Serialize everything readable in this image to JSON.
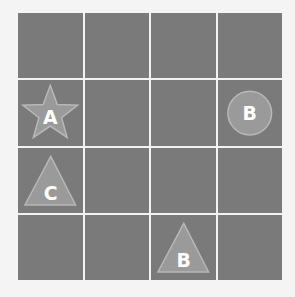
{
  "board": {
    "rows": 4,
    "cols": 4,
    "cell_color": "#7a7a7a",
    "line_color": "#f2f2f2",
    "piece_fill": "#9a9a9a",
    "piece_stroke": "#b8b8b8",
    "label_color": "#ffffff"
  },
  "pieces": [
    {
      "row": 1,
      "col": 0,
      "shape": "star",
      "label": "A"
    },
    {
      "row": 1,
      "col": 3,
      "shape": "circle",
      "label": "B"
    },
    {
      "row": 2,
      "col": 0,
      "shape": "triangle",
      "label": "C"
    },
    {
      "row": 3,
      "col": 2,
      "shape": "triangle",
      "label": "B"
    }
  ]
}
